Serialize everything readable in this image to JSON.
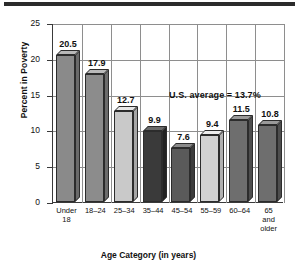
{
  "chart_data": {
    "type": "bar",
    "title": "",
    "xlabel": "Age Category (in years)",
    "ylabel": "Percent in Poverty",
    "categories": [
      "Under 18",
      "18–24",
      "25–34",
      "35–44",
      "45–54",
      "55–59",
      "60–64",
      "65 and older"
    ],
    "category_lines": [
      [
        "Under",
        "18"
      ],
      [
        "18–24"
      ],
      [
        "25–34"
      ],
      [
        "35–44"
      ],
      [
        "45–54"
      ],
      [
        "55–59"
      ],
      [
        "60–64"
      ],
      [
        "65",
        "and",
        "older"
      ]
    ],
    "values": [
      20.5,
      17.9,
      12.7,
      9.9,
      7.6,
      9.4,
      11.5,
      10.8
    ],
    "value_labels": [
      "20.5",
      "17.9",
      "12.7",
      "9.9",
      "7.6",
      "9.4",
      "11.5",
      "10.8"
    ],
    "ylim": [
      0,
      25
    ],
    "yticks": [
      0,
      5,
      10,
      15,
      20,
      25
    ],
    "ytick_labels": [
      "0",
      "5",
      "10",
      "15",
      "20",
      "25"
    ],
    "grid": "both",
    "legend": "none",
    "annotation": "U.S. average = 13.7%",
    "annotation_value": 13.7,
    "bar_colors": [
      "#8a8a8a",
      "#8c8c8c",
      "#c9c9c9",
      "#3a3a3a",
      "#5a5a5a",
      "#d2d2d2",
      "#6e6e6e",
      "#6e6e6e"
    ],
    "bar_top_colors": [
      "#b8b8b8",
      "#bababa",
      "#e8e8e8",
      "#6a6a6a",
      "#8a8a8a",
      "#eeeeee",
      "#9a9a9a",
      "#9a9a9a"
    ],
    "bar_side_colors": [
      "#6a6a6a",
      "#6c6c6c",
      "#a6a6a6",
      "#222222",
      "#3c3c3c",
      "#b0b0b0",
      "#4e4e4e",
      "#4e4e4e"
    ]
  },
  "colors": {
    "axis": "#3a3a3a",
    "grid": "#8e8e8e",
    "text": "#111111",
    "rule": "#2b2b2b",
    "background": "#ffffff"
  }
}
